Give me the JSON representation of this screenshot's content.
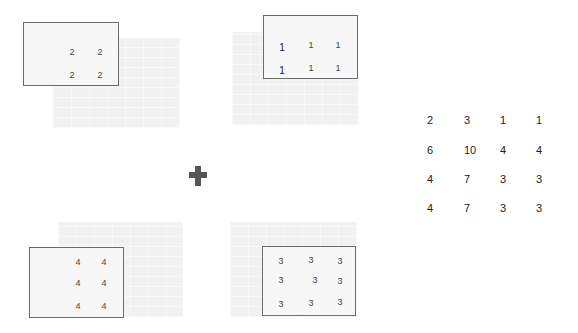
{
  "operation_icon": "plus-icon",
  "panels": [
    {
      "name": "top-left",
      "values": [
        [
          "2",
          "2"
        ],
        [
          "2",
          "2"
        ]
      ]
    },
    {
      "name": "top-right",
      "values": [
        [
          "1",
          "1",
          "1"
        ],
        [
          "1",
          "1",
          "1"
        ]
      ]
    },
    {
      "name": "bottom-left",
      "values": [
        [
          "4",
          "4"
        ],
        [
          "4",
          "4"
        ],
        [
          "4",
          "4"
        ]
      ]
    },
    {
      "name": "bottom-right",
      "values": [
        [
          "3",
          "3",
          "3"
        ],
        [
          "3",
          "3",
          "3"
        ],
        [
          "3",
          "3",
          "3"
        ]
      ]
    }
  ],
  "result_matrix": [
    [
      "2",
      "3",
      "1",
      "1"
    ],
    [
      "6",
      "10",
      "4",
      "4"
    ],
    [
      "4",
      "7",
      "3",
      "3"
    ],
    [
      "4",
      "7",
      "3",
      "3"
    ]
  ]
}
